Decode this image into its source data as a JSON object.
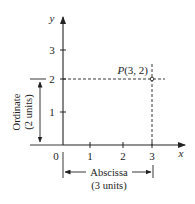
{
  "diagram": {
    "axes": {
      "x_label": "x",
      "y_label": "y",
      "origin_label": "0",
      "x_ticks": [
        "1",
        "2",
        "3"
      ],
      "y_ticks": [
        "1",
        "2",
        "3"
      ]
    },
    "point": {
      "label_prefix": "P",
      "label_coords": "(3, 2)",
      "x": 3,
      "y": 2
    },
    "ordinate": {
      "label": "Ordinate",
      "units": "(2 units)"
    },
    "abscissa": {
      "label": "Abscissa",
      "units": "(3 units)"
    },
    "colors": {
      "ink": "#222222",
      "background": "#ffffff"
    }
  }
}
